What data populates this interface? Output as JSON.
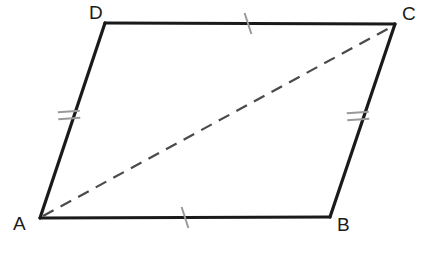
{
  "figure": {
    "kind": "geometry-diagram",
    "shape": "parallelogram",
    "canvas": {
      "width": 425,
      "height": 266
    },
    "background_color": "#ffffff"
  },
  "colors": {
    "side_stroke": "#1a1a1a",
    "diagonal_stroke": "#4a4a4a",
    "tick_stroke": "#9a9a9a",
    "label_text": "#1b1b1b",
    "background": "#ffffff"
  },
  "labels": {
    "a": "A",
    "b": "B",
    "c": "C",
    "d": "D"
  },
  "vertices": [
    {
      "name": "A",
      "x": 40,
      "y": 218,
      "label": "A",
      "label_x": 13,
      "label_y": 214
    },
    {
      "name": "B",
      "x": 330,
      "y": 217,
      "label": "B",
      "label_x": 337,
      "label_y": 215
    },
    {
      "name": "C",
      "x": 395,
      "y": 24,
      "label": "C",
      "label_x": 402,
      "label_y": 4
    },
    {
      "name": "D",
      "x": 105,
      "y": 23,
      "label": "D",
      "label_x": 89,
      "label_y": 3
    }
  ],
  "sides": [
    {
      "name": "AB",
      "from": "A",
      "to": "B",
      "x1": 40,
      "y1": 218,
      "x2": 330,
      "y2": 217,
      "style": "solid",
      "stroke_width": 3.2,
      "tick_count": 1
    },
    {
      "name": "BC",
      "from": "B",
      "to": "C",
      "x1": 330,
      "y1": 217,
      "x2": 395,
      "y2": 24,
      "style": "solid",
      "stroke_width": 3.2,
      "tick_count": 2
    },
    {
      "name": "CD",
      "from": "C",
      "to": "D",
      "x1": 395,
      "y1": 24,
      "x2": 105,
      "y2": 23,
      "style": "solid",
      "stroke_width": 3.2,
      "tick_count": 1
    },
    {
      "name": "DA",
      "from": "D",
      "to": "A",
      "x1": 105,
      "y1": 23,
      "x2": 40,
      "y2": 218,
      "style": "solid",
      "stroke_width": 3.2,
      "tick_count": 2
    }
  ],
  "diagonal": {
    "name": "AC",
    "from": "A",
    "to": "C",
    "x1": 43,
    "y1": 216,
    "x2": 393,
    "y2": 26,
    "style": "dashed",
    "stroke_width": 2.2,
    "dash_length": 12,
    "gap_length": 8
  },
  "tick_marks": [
    {
      "on_side": "AB",
      "count": 1,
      "cx": 185,
      "cy": 217.5,
      "angle_deg": 72,
      "length": 22,
      "spacing": 0
    },
    {
      "on_side": "CD",
      "count": 1,
      "cx": 248,
      "cy": 23.5,
      "angle_deg": 72,
      "length": 22,
      "spacing": 0
    },
    {
      "on_side": "DA",
      "count": 2,
      "cx": 69,
      "cy": 115,
      "angle_deg": 176,
      "length": 22,
      "spacing": 7
    },
    {
      "on_side": "BC",
      "count": 2,
      "cx": 358,
      "cy": 116,
      "angle_deg": 176,
      "length": 22,
      "spacing": 7
    }
  ]
}
